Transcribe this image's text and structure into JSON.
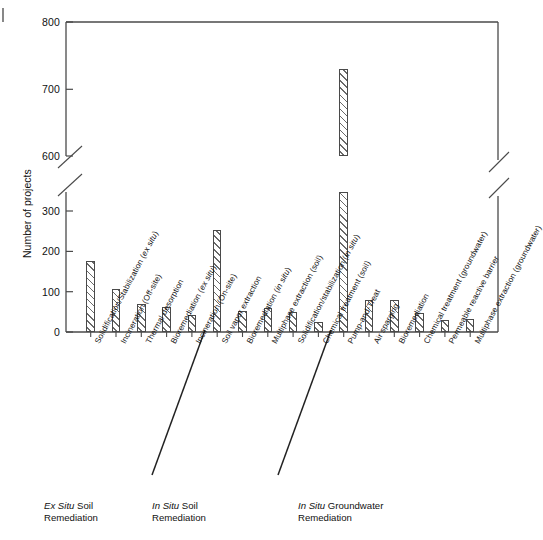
{
  "figure": {
    "y_axis_title": "Number of projects",
    "y_ticks": [
      "0",
      "100",
      "200",
      "300",
      "600",
      "700",
      "800"
    ],
    "axis_break_note": "y-axis broken between 300 and 600"
  },
  "groups": [
    {
      "line1_em": "Ex Situ",
      "line1_rest": " Soil",
      "line2": "Remediation"
    },
    {
      "line1_em": "In Situ",
      "line1_rest": " Soil",
      "line2": "Remediation"
    },
    {
      "line1_em": "In Situ",
      "line1_rest": " Groundwater",
      "line2": "Remediation"
    }
  ],
  "chart_data": {
    "type": "bar",
    "title": "",
    "xlabel": "",
    "ylabel": "Number of projects",
    "ylim": [
      0,
      800
    ],
    "y_break": [
      300,
      600
    ],
    "grid": false,
    "legend": "none",
    "categories": [
      "Solidification/Stabilization (ex situ)",
      "Incineration (Off-site)",
      "Thermal desorption",
      "Bioremediation (ex situ)",
      "Incineration (On-site)",
      "Soil vapor extraction",
      "Bioremediation (in situ)",
      "Multiphase  extraction (soil)",
      "Solidification/stabilization (in situ)",
      "Chemical treatment (soil)",
      "Pump-and-Treat",
      "Air sparging",
      "Bioremediation",
      "Chemical treatment (groundwater)",
      "Permeable reactive barrier",
      "Multiphase extraction (groundwater)"
    ],
    "values": [
      175,
      107,
      70,
      62,
      43,
      252,
      53,
      60,
      50,
      24,
      730,
      79,
      79,
      46,
      30,
      32
    ],
    "group_spans": [
      {
        "label": "Ex Situ Soil Remediation",
        "from": 0,
        "to": 4
      },
      {
        "label": "In Situ Soil Remediation",
        "from": 5,
        "to": 9
      },
      {
        "label": "In Situ Groundwater Remediation",
        "from": 10,
        "to": 15
      }
    ]
  }
}
